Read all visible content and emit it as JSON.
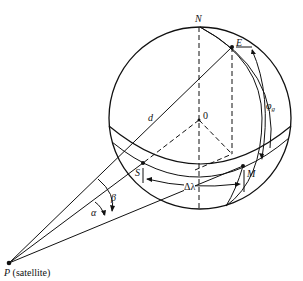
{
  "diagram": {
    "colors": {
      "stroke": "#111111",
      "background": "#ffffff"
    },
    "labels": {
      "north": "N",
      "earth_station": "E",
      "center": "0",
      "distance": "d",
      "latitude": "φ",
      "latitude_sub": "g",
      "subsatellite": "S",
      "equator_point": "M",
      "delta_lambda": "Δλ",
      "alpha": "α",
      "beta": "β",
      "satellite_letter": "P",
      "satellite_text": "(satellite)"
    }
  }
}
